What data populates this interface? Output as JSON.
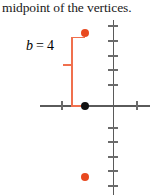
{
  "caption": {
    "text": "midpoint of the vertices."
  },
  "figure": {
    "label": {
      "variable": "b",
      "equals": "=",
      "value": "4",
      "full_text": "b = 4"
    },
    "colors": {
      "axis": "#5a5a5a",
      "tick": "#6b6b6b",
      "point_center": "#111111",
      "point_vertex": "#e8491f",
      "brace": "#f0704e",
      "text": "#1a1a1a",
      "background": "#ffffff"
    },
    "points": [
      {
        "name": "upper-vertex",
        "color": "#e8491f",
        "x": 85,
        "y": 15
      },
      {
        "name": "center-point",
        "color": "#111111",
        "x": 85,
        "y": 87
      },
      {
        "name": "lower-vertex",
        "color": "#e8491f",
        "x": 85,
        "y": 159
      }
    ],
    "axes": {
      "x_axis": {
        "left": 40,
        "top": 87,
        "length": 110
      },
      "y_axis": {
        "left": 112,
        "top": 2,
        "length": 175
      },
      "x_ticks": [
        61,
        136
      ],
      "y_ticks": [
        7,
        22,
        37,
        51,
        66,
        109,
        123,
        138,
        152,
        167
      ]
    },
    "brace": {
      "top": 15,
      "bottom": 87,
      "stem_x": 71,
      "notch_y": 46
    }
  }
}
